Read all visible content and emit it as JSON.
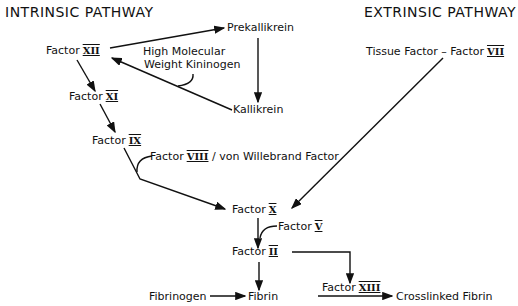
{
  "titles": {
    "intrinsic": "INTRINSIC PATHWAY",
    "extrinsic": "EXTRINSIC PATHWAY"
  },
  "nodes": {
    "prekallikrein": "Prekallikrein",
    "factor_xii": {
      "label": "Factor",
      "numeral": "XII"
    },
    "hmwk_line1": "High Molecular",
    "hmwk_line2": "Weight Kininogen",
    "kallikrein": "Kallikrein",
    "factor_xi": {
      "label": "Factor",
      "numeral": "XI"
    },
    "factor_ix": {
      "label": "Factor",
      "numeral": "IX"
    },
    "factor_viii": {
      "label": "Factor",
      "numeral": "VIII",
      "suffix": "/ von Willebrand Factor"
    },
    "tissue_factor": {
      "label": "Tissue Factor – Factor",
      "numeral": "VII"
    },
    "factor_x": {
      "label": "Factor",
      "numeral": "X"
    },
    "factor_v": {
      "label": "Factor",
      "numeral": "V"
    },
    "factor_ii": {
      "label": "Factor",
      "numeral": "II"
    },
    "fibrinogen": "Fibrinogen",
    "fibrin": "Fibrin",
    "factor_xiii": {
      "label": "Factor",
      "numeral": "XIII"
    },
    "crosslinked_fibrin": "Crosslinked Fibrin"
  }
}
